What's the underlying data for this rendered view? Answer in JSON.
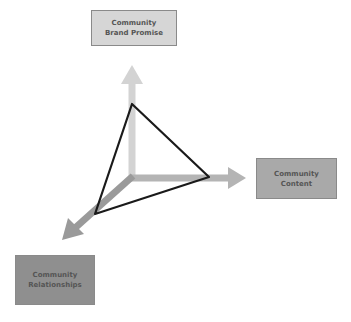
{
  "diagram": {
    "boxes": {
      "top": {
        "line1": "Community",
        "line2": "Brand Promise",
        "fill": "#d6d6d6"
      },
      "right": {
        "line1": "Community",
        "line2": "Content",
        "fill": "#a9a9a9"
      },
      "bottom_left": {
        "line1": "Community",
        "line2": "Relationships",
        "fill": "#8f8f8f"
      }
    },
    "axes": {
      "up_color": "#d3d3d3",
      "right_color": "#b4b4b4",
      "down_left_color": "#9a9a9a"
    },
    "triangle": {
      "stroke": "#1a1a1a"
    }
  }
}
